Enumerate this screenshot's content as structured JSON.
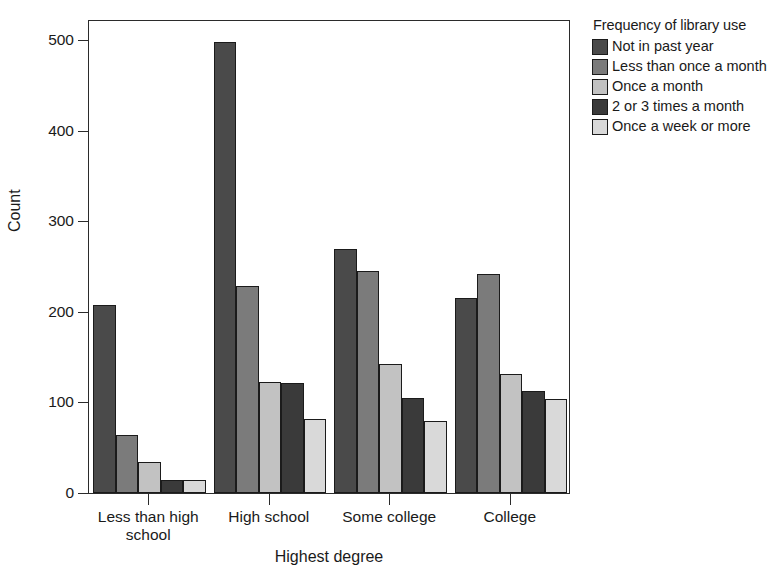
{
  "chart_data": {
    "type": "bar",
    "title": "",
    "xlabel": "Highest degree",
    "ylabel": "Count",
    "ylim": [
      0,
      500
    ],
    "yticks": [
      0,
      100,
      200,
      300,
      400,
      500
    ],
    "grid": false,
    "legend_position": "right",
    "legend_title": "Frequency of library use",
    "categories": [
      "Less than high school",
      "High school",
      "Some college",
      "College"
    ],
    "category_labels": [
      [
        "Less than high",
        "school"
      ],
      [
        "High school"
      ],
      [
        "Some college"
      ],
      [
        "College"
      ]
    ],
    "series": [
      {
        "name": "Not in past year",
        "color": "#4a4a4a",
        "values": [
          208,
          498,
          269,
          215
        ]
      },
      {
        "name": "Less than once a month",
        "color": "#7b7b7b",
        "values": [
          64,
          228,
          245,
          242
        ]
      },
      {
        "name": "Once a month",
        "color": "#c2c2c2",
        "values": [
          34,
          122,
          142,
          131
        ]
      },
      {
        "name": "2 or 3 times a month",
        "color": "#3a3a3a",
        "values": [
          14,
          121,
          105,
          113
        ]
      },
      {
        "name": "Once a week or more",
        "color": "#d9d9d9",
        "values": [
          14,
          82,
          80,
          104
        ]
      }
    ]
  },
  "legend": {
    "title": "Frequency of library use",
    "items": [
      {
        "label": "Not in past year",
        "color": "#4a4a4a"
      },
      {
        "label": "Less than once a month",
        "color": "#7b7b7b"
      },
      {
        "label": "Once a month",
        "color": "#c2c2c2"
      },
      {
        "label": "2 or 3 times a month",
        "color": "#3a3a3a"
      },
      {
        "label": "Once a week or more",
        "color": "#d9d9d9"
      }
    ]
  },
  "axes": {
    "y_title": "Count",
    "x_title": "Highest degree",
    "y_tick_labels": [
      "0",
      "100",
      "200",
      "300",
      "400",
      "500"
    ]
  }
}
